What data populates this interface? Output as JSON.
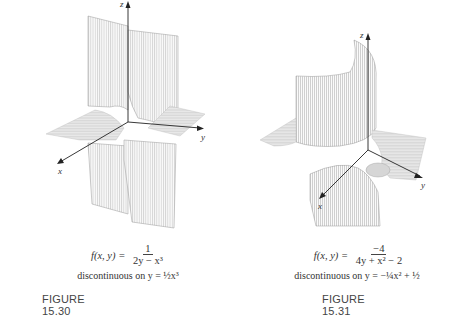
{
  "figures": [
    {
      "id": "15.30",
      "label": "FIGURE 15.30",
      "formula_lhs": "f(x, y) =",
      "formula_num": "1",
      "formula_den": "2y − x³",
      "discontinuity": "discontinuous on y = ½x³",
      "axes": {
        "x": "x",
        "y": "y",
        "z": "z"
      }
    },
    {
      "id": "15.31",
      "label": "FIGURE 15.31",
      "formula_lhs": "f(x, y) =",
      "formula_num": "−4",
      "formula_den": "4y + x² − 2",
      "discontinuity": "discontinuous on y = −¼x² + ½",
      "axes": {
        "x": "x",
        "y": "y",
        "z": "z"
      }
    }
  ],
  "colors": {
    "surface_line": "#9a9a9a",
    "surface_fill": "#e6e6e6",
    "axis": "#222222",
    "text": "#333333"
  }
}
